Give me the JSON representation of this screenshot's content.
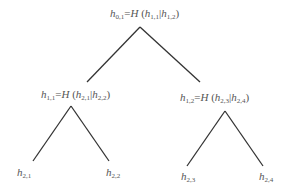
{
  "diagram": {
    "type": "binary-hash-tree",
    "nodes": {
      "root": {
        "id": "h_{0,1}",
        "var": "h",
        "sub": "0,1",
        "func": "H",
        "left": {
          "var": "h",
          "sub": "1,1"
        },
        "right": {
          "var": "h",
          "sub": "1,2"
        },
        "text": "h0,1=H (h1,1|h1,2)"
      },
      "level1_left": {
        "id": "h_{1,1}",
        "var": "h",
        "sub": "1,1",
        "func": "H",
        "left": {
          "var": "h",
          "sub": "2,1"
        },
        "right": {
          "var": "h",
          "sub": "2,2"
        },
        "text": "h1,1=H (h2,1|h2,2)"
      },
      "level1_right": {
        "id": "h_{1,2}",
        "var": "h",
        "sub": "1,2",
        "func": "H",
        "left": {
          "var": "h",
          "sub": "2,3"
        },
        "right": {
          "var": "h",
          "sub": "2,4"
        },
        "text": "h1,2=H (h2,3|h2,4)"
      },
      "leaves": [
        {
          "var": "h",
          "sub": "2,1"
        },
        {
          "var": "h",
          "sub": "2,2"
        },
        {
          "var": "h",
          "sub": "2,3"
        },
        {
          "var": "h",
          "sub": "2,4"
        }
      ]
    },
    "symbols": {
      "equals": "=",
      "open_paren": " (",
      "close_paren": ")",
      "separator": "|"
    },
    "colors": {
      "edge": "#333333",
      "text": "#555555",
      "background": "#ffffff"
    }
  }
}
